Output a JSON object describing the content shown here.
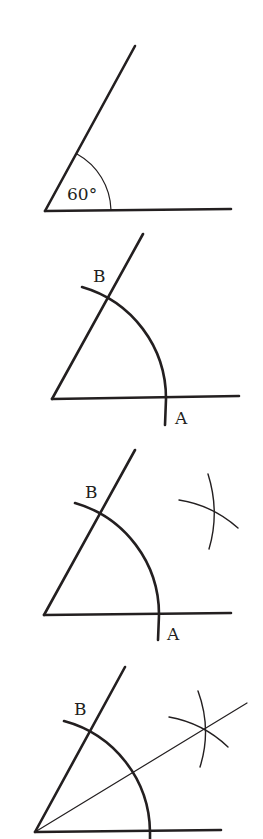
{
  "figure": {
    "background": "#ffffff",
    "ink_color": "#231f20",
    "steps": [
      {
        "step": 1,
        "angle_label": "60°",
        "labels": []
      },
      {
        "step": 2,
        "labels": [
          {
            "text": "B",
            "role": "intersection of arc with upper ray"
          },
          {
            "text": "A",
            "role": "intersection of arc with horizontal ray"
          }
        ]
      },
      {
        "step": 3,
        "labels": [
          {
            "text": "B",
            "role": "intersection of arc with upper ray"
          },
          {
            "text": "A",
            "role": "intersection of arc with horizontal ray"
          }
        ],
        "extra": "two intersecting arcs drawn from A and B"
      },
      {
        "step": 4,
        "labels": [
          {
            "text": "B",
            "role": "intersection of arc with upper ray"
          }
        ],
        "extra": "bisector line from vertex through intersection of arcs"
      }
    ]
  }
}
